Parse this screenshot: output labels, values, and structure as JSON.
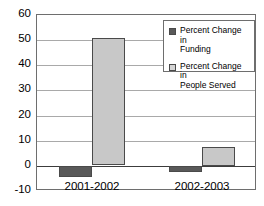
{
  "chart_data": {
    "type": "bar",
    "title": "",
    "xlabel": "",
    "ylabel": "",
    "ylim": [
      -10,
      60
    ],
    "ytick_step": 10,
    "grid": true,
    "legend_position": "top-right",
    "categories": [
      "2001-2002",
      "2002-2003"
    ],
    "yticks": [
      "60",
      "50",
      "40",
      "30",
      "20",
      "10",
      "0",
      "-10"
    ],
    "series": [
      {
        "name": "Percent Change in Funding",
        "legend_line1": "Percent Change in",
        "legend_line2": "Funding",
        "color": "#595959",
        "values": [
          -4.3,
          -2.5
        ]
      },
      {
        "name": "Percent Change in People Served",
        "legend_line1": "Percent Change in",
        "legend_line2": "People Served",
        "color": "#c8c8c8",
        "values": [
          50.7,
          7.5
        ]
      }
    ]
  },
  "colors": {
    "funding": "#595959",
    "people_served": "#c8c8c8",
    "frame": "#6e6e6e",
    "gridline": "#a9a9a9",
    "zeroline": "#3c3c3c",
    "background": "#ffffff"
  }
}
